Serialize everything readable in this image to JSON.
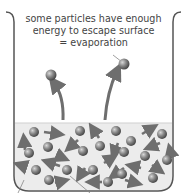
{
  "caption": {
    "line1": "some particles have enough",
    "line2": "energy to escape surface",
    "line3": "= evaporation"
  },
  "colors": {
    "particle": "#7a7a7a",
    "arrow": "#707070",
    "liquid": "#ececec",
    "beaker": "#555555"
  }
}
